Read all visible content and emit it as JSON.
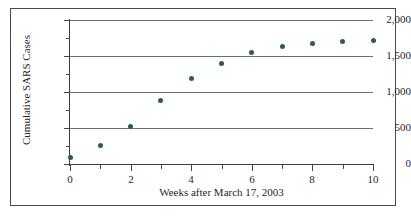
{
  "chart_data": {
    "type": "scatter",
    "title": "",
    "xlabel": "Weeks after March 17, 2003",
    "ylabel": "Cumulative SARS Cases",
    "x": [
      0,
      1,
      2,
      3,
      4,
      5,
      6,
      7,
      8,
      9,
      10
    ],
    "values": [
      90,
      260,
      520,
      880,
      1190,
      1400,
      1555,
      1630,
      1675,
      1705,
      1715
    ],
    "series": [
      {
        "name": "Cumulative SARS Cases",
        "values": [
          90,
          260,
          520,
          880,
          1190,
          1400,
          1555,
          1630,
          1675,
          1705,
          1715
        ]
      }
    ],
    "xlim": [
      0,
      10
    ],
    "ylim": [
      0,
      2000
    ],
    "xticks": [
      0,
      2,
      4,
      6,
      8,
      10
    ],
    "xtick_labels": [
      "0",
      "2",
      "4",
      "6",
      "8",
      "10"
    ],
    "xticks_minor": [
      1,
      3,
      5,
      7,
      9
    ],
    "yticks": [
      0,
      500,
      1000,
      1500,
      2000
    ],
    "ytick_labels": [
      "0",
      "500",
      "1,000",
      "1,500",
      "2,000"
    ],
    "yticks_minor": [
      250,
      750,
      1250,
      1750
    ],
    "grid": "horizontal",
    "legend": "none",
    "marker_color": "#2e5c52",
    "axis_color": "#3d3d3d",
    "grid_color": "#6f6f6f",
    "background_color": "#ffffff"
  }
}
